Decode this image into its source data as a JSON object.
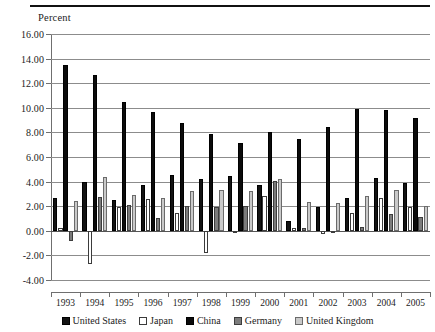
{
  "figure": {
    "axis_title": "Percent"
  },
  "chart_data": {
    "type": "bar",
    "title": "",
    "xlabel": "",
    "ylabel": "Percent",
    "ylim": [
      -4.0,
      16.0
    ],
    "ytick_step": 2.0,
    "grid": true,
    "legend_position": "bottom",
    "ytick_labels": [
      "16.00",
      "14.00",
      "12.00",
      "10.00",
      "8.00",
      "6.00",
      "4.00",
      "2.00",
      "0.00",
      "-2.00",
      "-4.00"
    ],
    "ytick_values": [
      16,
      14,
      12,
      10,
      8,
      6,
      4,
      2,
      0,
      -2,
      -4
    ],
    "categories": [
      "1993",
      "1994",
      "1995",
      "1996",
      "1997",
      "1998",
      "1999",
      "2000",
      "2001",
      "2002",
      "2003",
      "2004",
      "2005"
    ],
    "series": [
      {
        "name": "United States",
        "key": "us",
        "color": "#131313",
        "values": [
          2.65,
          4.0,
          2.5,
          3.75,
          4.5,
          4.25,
          4.45,
          3.7,
          0.8,
          1.9,
          2.7,
          4.3,
          3.85
        ]
      },
      {
        "name": "Japan",
        "key": "jp",
        "color": "#ffffff",
        "values": [
          0.2,
          -2.7,
          1.95,
          2.6,
          1.45,
          -1.8,
          -0.1,
          2.85,
          0.2,
          -0.3,
          1.45,
          2.7,
          1.9
        ]
      },
      {
        "name": "China",
        "key": "cn",
        "color": "#0b0b0b",
        "values": [
          13.5,
          12.65,
          10.45,
          9.65,
          8.8,
          7.85,
          7.1,
          8.0,
          7.5,
          8.4,
          9.9,
          9.85,
          9.2
        ]
      },
      {
        "name": "Germany",
        "key": "de",
        "color": "#7c7c7c",
        "values": [
          -0.8,
          2.75,
          2.1,
          1.05,
          2.05,
          1.9,
          2.0,
          4.05,
          0.2,
          0.0,
          0.3,
          1.35,
          1.1
        ]
      },
      {
        "name": "United Kingdom",
        "key": "uk",
        "color": "#c9c9c9",
        "values": [
          2.4,
          4.4,
          2.95,
          2.7,
          3.2,
          3.3,
          3.2,
          4.25,
          2.35,
          2.3,
          2.85,
          3.3,
          2.05
        ]
      }
    ]
  },
  "legend": {
    "items": [
      {
        "label": "United States",
        "key": "us"
      },
      {
        "label": "Japan",
        "key": "jp"
      },
      {
        "label": "China",
        "key": "cn"
      },
      {
        "label": "Germany",
        "key": "de"
      },
      {
        "label": "United Kingdom",
        "key": "uk"
      }
    ]
  }
}
